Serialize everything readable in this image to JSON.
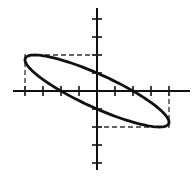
{
  "diagram": {
    "type": "lissajous-ellipse",
    "center_px": [
      97,
      91
    ],
    "unit_px": 18,
    "x_axis": {
      "from_px": 13,
      "to_px": 190,
      "ticks": [
        -4,
        -3,
        -2,
        -1,
        1,
        2,
        3,
        4
      ]
    },
    "y_axis": {
      "from_px": 8,
      "to_px": 170,
      "ticks": [
        -4,
        -3,
        -2,
        -1,
        1,
        2,
        3,
        4
      ]
    },
    "bounding_box": {
      "x_min": -4,
      "x_max": 4,
      "y_min": -2,
      "y_max": 2,
      "style": "dashed"
    },
    "ellipse": {
      "x_amplitude": 4,
      "y_amplitude": 2,
      "phase_deg": 150,
      "y_intercepts": [
        1,
        -1
      ],
      "x_intercepts": [
        -2,
        2
      ]
    },
    "colors": {
      "stroke": "#111111",
      "dash": "#333333",
      "background": "#ffffff"
    }
  }
}
